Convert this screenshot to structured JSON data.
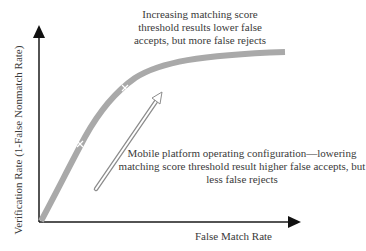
{
  "diagram": {
    "title": "",
    "annotations": {
      "top": [
        "Increasing matching score",
        "threshold results lower false",
        "accepts, but more false rejects"
      ],
      "bottom": [
        "Mobile platform operating configuration—lowering",
        "matching score threshold result higher false accepts, but",
        "less false rejects"
      ]
    },
    "axes": {
      "x_label": "False Match Rate",
      "y_label": "Verification Rate (1-False Nonmatch Rate)"
    },
    "colors": {
      "curve": "#a9a9a9",
      "axis": "#1a1a1a",
      "arrow_outline": "#8c8c8c",
      "marker": "#ffffff"
    }
  }
}
